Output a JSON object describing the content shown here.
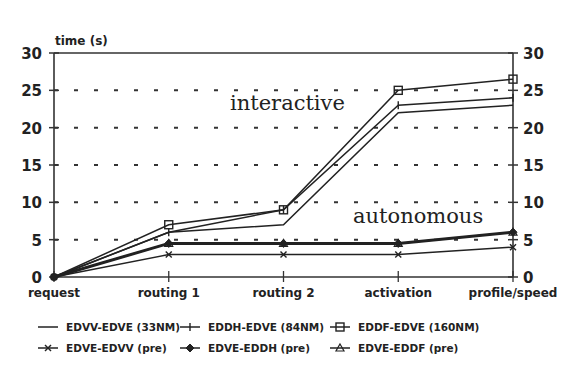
{
  "chart_data": {
    "type": "line",
    "title": "",
    "ylabel": "time (s)",
    "xlabel": "",
    "ylim": [
      0,
      30
    ],
    "yticks": [
      0,
      5,
      10,
      15,
      20,
      25,
      30
    ],
    "grid": "dashed horizontal at 5-unit intervals",
    "categories": [
      "request",
      "routing 1",
      "routing 2",
      "activation",
      "profile/speed"
    ],
    "series": [
      {
        "name": "EDVV-EDVE (33NM)",
        "marker": "none",
        "values": [
          0,
          6,
          7,
          22,
          23
        ]
      },
      {
        "name": "EDDH-EDVE (84NM)",
        "marker": "plus",
        "values": [
          0,
          6,
          9,
          23,
          24
        ]
      },
      {
        "name": "EDDF-EDVE (160NM)",
        "marker": "square",
        "values": [
          0,
          7,
          9,
          25,
          26.5
        ]
      },
      {
        "name": "EDVE-EDVV (pre)",
        "marker": "x",
        "values": [
          0,
          3,
          3,
          3,
          4
        ]
      },
      {
        "name": "EDVE-EDDH (pre)",
        "marker": "diamond",
        "values": [
          0,
          4.5,
          4.5,
          4.5,
          6
        ]
      },
      {
        "name": "EDVE-EDDF (pre)",
        "marker": "triangle",
        "values": [
          0,
          4.5,
          4.5,
          4.5,
          6
        ]
      }
    ],
    "annotations": [
      "interactive",
      "autonomous"
    ],
    "legend_position": "bottom"
  },
  "axis": {
    "ylabel": "time (s)"
  },
  "annotations": {
    "interactive": "interactive",
    "autonomous": "autonomous"
  },
  "legend": [
    "EDVV-EDVE (33NM)",
    "EDDH-EDVE (84NM)",
    "EDDF-EDVE (160NM)",
    "EDVE-EDVV (pre)",
    "EDVE-EDDH (pre)",
    "EDVE-EDDF (pre)"
  ]
}
